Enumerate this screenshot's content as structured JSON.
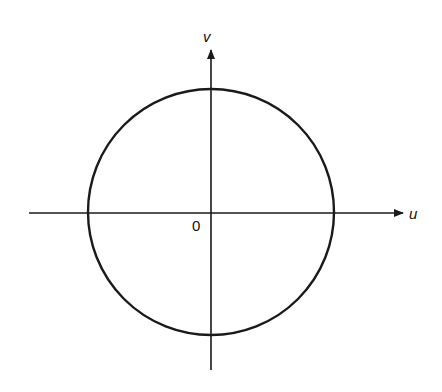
{
  "diagram": {
    "type": "circle-on-axes",
    "labels": {
      "vertical_axis": "v",
      "horizontal_axis": "u",
      "origin": "0"
    },
    "geometry": {
      "center": [
        211,
        212
      ],
      "radius": 123,
      "h_axis": {
        "x1": 29,
        "x2": 403,
        "y": 213
      },
      "v_axis": {
        "x": 211,
        "y1": 50,
        "y2": 370
      }
    },
    "colors": {
      "stroke": "#1a1a1a",
      "background": "#ffffff"
    }
  }
}
